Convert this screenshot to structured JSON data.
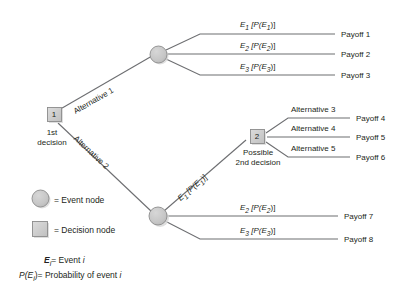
{
  "diagram": {
    "colors": {
      "node_fill": "#c9c9c9",
      "node_stroke": "#8c8c8c",
      "line": "#6d6e71",
      "text": "#231f20",
      "background": "#ffffff",
      "shadow": "#d9d9d9"
    },
    "nodes": [
      {
        "id": "decision-1",
        "type": "decision",
        "label": "1",
        "sub_label_line1": "1st",
        "sub_label_line2": "decision"
      },
      {
        "id": "event-1",
        "type": "event",
        "label": ""
      },
      {
        "id": "event-2",
        "type": "event",
        "label": ""
      },
      {
        "id": "decision-2",
        "type": "decision",
        "label": "2",
        "sub_label_line1": "Possible",
        "sub_label_line2": "2nd decision"
      }
    ],
    "branches": [
      {
        "id": "alt-1",
        "label": "Alternative 1",
        "orientation": "diagonal-up"
      },
      {
        "id": "alt-2",
        "label": "Alternative 2",
        "orientation": "diagonal-down"
      },
      {
        "id": "e1-top",
        "label_main": "E",
        "label_sub": "1",
        "label_prob": "[P(E",
        "label_prob_sub": "1",
        "label_prob_end": ")]",
        "orientation": "horizontal"
      },
      {
        "id": "e2-top",
        "label_main": "E",
        "label_sub": "2",
        "orientation": "horizontal"
      },
      {
        "id": "e3-top",
        "label_main": "E",
        "label_sub": "3",
        "orientation": "horizontal"
      },
      {
        "id": "e1-mid",
        "orientation": "diagonal-up"
      },
      {
        "id": "e2-bot",
        "orientation": "horizontal"
      },
      {
        "id": "e3-bot",
        "orientation": "horizontal"
      },
      {
        "id": "alt-3",
        "label": "Alternative 3",
        "orientation": "diagonal-up"
      },
      {
        "id": "alt-4",
        "label": "Alternative 4",
        "orientation": "horizontal"
      },
      {
        "id": "alt-5",
        "label": "Alternative 5",
        "orientation": "diagonal-down"
      }
    ],
    "event_labels": {
      "e1": {
        "event": "E",
        "event_sub": "1",
        "prob_open": "[P(E",
        "prob_sub": "1",
        "prob_close": ")]"
      },
      "e2": {
        "event": "E",
        "event_sub": "2",
        "prob_open": "[P(E",
        "prob_sub": "2",
        "prob_close": ")]"
      },
      "e3": {
        "event": "E",
        "event_sub": "3",
        "prob_open": "[P(E",
        "prob_sub": "3",
        "prob_close": ")]"
      }
    },
    "alternative_labels": {
      "alt1": "Alternative 1",
      "alt2": "Alternative 2",
      "alt3": "Alternative 3",
      "alt4": "Alternative 4",
      "alt5": "Alternative 5"
    },
    "payoffs": [
      {
        "id": "payoff-1",
        "label": "Payoff 1"
      },
      {
        "id": "payoff-2",
        "label": "Payoff 2"
      },
      {
        "id": "payoff-3",
        "label": "Payoff 3"
      },
      {
        "id": "payoff-4",
        "label": "Payoff 4"
      },
      {
        "id": "payoff-5",
        "label": "Payoff 5"
      },
      {
        "id": "payoff-6",
        "label": "Payoff 6"
      },
      {
        "id": "payoff-7",
        "label": "Payoff 7"
      },
      {
        "id": "payoff-8",
        "label": "Payoff 8"
      }
    ],
    "node_captions": {
      "first_decision_line1": "1st",
      "first_decision_line2": "decision",
      "second_decision_line1": "Possible",
      "second_decision_line2": "2nd decision",
      "node1_number": "1",
      "node2_number": "2"
    },
    "legend": {
      "event_node": "= Event node",
      "decision_node": "= Decision node",
      "event_def": {
        "symbol": "E",
        "symbol_sub": "i",
        "text": "= Event ",
        "var": "i"
      },
      "prob_def": {
        "symbol": "P(E",
        "symbol_sub": "i",
        "symbol_close": ")",
        "text": "= Probability of event ",
        "var": "i"
      }
    }
  }
}
